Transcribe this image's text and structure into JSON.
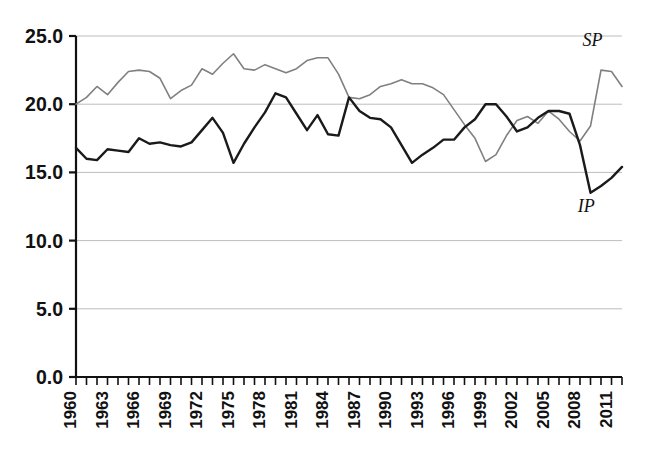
{
  "chart_data": {
    "type": "line",
    "title": "",
    "subtitle": "",
    "xlabel": "",
    "ylabel": "",
    "xlim": [
      1960,
      2012
    ],
    "ylim": [
      0.0,
      25.0
    ],
    "grid": true,
    "grid_axis": "y",
    "legend": "inline-annotations",
    "y_ticks": [
      0.0,
      5.0,
      10.0,
      15.0,
      20.0,
      25.0
    ],
    "y_tick_labels": [
      "0.0",
      "5.0",
      "10.0",
      "15.0",
      "20.0",
      "25.0"
    ],
    "x_tick_labels": [
      "1960",
      "1963",
      "1966",
      "1969",
      "1972",
      "1975",
      "1978",
      "1981",
      "1984",
      "1987",
      "1990",
      "1993",
      "1996",
      "1999",
      "2002",
      "2005",
      "2008",
      "2011"
    ],
    "x_tick_label_rotation": -90,
    "x_minor_tick_interval": 1,
    "x": [
      1960,
      1961,
      1962,
      1963,
      1964,
      1965,
      1966,
      1967,
      1968,
      1969,
      1970,
      1971,
      1972,
      1973,
      1974,
      1975,
      1976,
      1977,
      1978,
      1979,
      1980,
      1981,
      1982,
      1983,
      1984,
      1985,
      1986,
      1987,
      1988,
      1989,
      1990,
      1991,
      1992,
      1993,
      1994,
      1995,
      1996,
      1997,
      1998,
      1999,
      2000,
      2001,
      2002,
      2003,
      2004,
      2005,
      2006,
      2007,
      2008,
      2009,
      2010,
      2011,
      2012
    ],
    "series": [
      {
        "name": "SP",
        "label": "SP",
        "color": "#808080",
        "line_width": 1.6,
        "label_position": {
          "x": 2009.2,
          "y": 24.3
        },
        "values": [
          20.0,
          20.5,
          21.3,
          20.7,
          21.6,
          22.4,
          22.5,
          22.4,
          21.9,
          20.4,
          21.0,
          21.4,
          22.6,
          22.2,
          23.0,
          23.7,
          22.6,
          22.5,
          22.9,
          22.6,
          22.3,
          22.6,
          23.2,
          23.4,
          23.4,
          22.2,
          20.5,
          20.4,
          20.7,
          21.3,
          21.5,
          21.8,
          21.5,
          21.5,
          21.2,
          20.7,
          19.6,
          18.5,
          17.5,
          15.8,
          16.3,
          17.7,
          18.8,
          19.1,
          18.6,
          19.5,
          18.9,
          18.0,
          17.3,
          18.4,
          22.5,
          22.4,
          21.3
        ]
      },
      {
        "name": "IP",
        "label": "IP",
        "color": "#1a1a1a",
        "line_width": 2.4,
        "label_position": {
          "x": 2008.6,
          "y": 12.1
        },
        "values": [
          16.8,
          16.0,
          15.9,
          16.7,
          16.6,
          16.5,
          17.5,
          17.1,
          17.2,
          17.0,
          16.9,
          17.2,
          18.1,
          19.0,
          17.9,
          15.7,
          17.1,
          18.3,
          19.4,
          20.8,
          20.5,
          19.3,
          18.1,
          19.2,
          17.8,
          17.7,
          20.5,
          19.5,
          19.0,
          18.9,
          18.3,
          17.0,
          15.7,
          16.3,
          16.8,
          17.4,
          17.4,
          18.3,
          18.9,
          20.0,
          20.0,
          19.1,
          18.0,
          18.3,
          19.0,
          19.5,
          19.5,
          19.3,
          17.0,
          13.5,
          14.0,
          14.6,
          15.4
        ]
      }
    ]
  }
}
